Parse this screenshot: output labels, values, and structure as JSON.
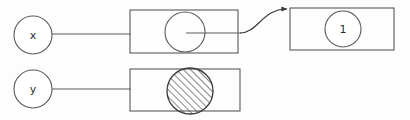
{
  "diagram": {
    "background_color": "#fdfdfd",
    "stroke_color": "#5a5a5a",
    "stroke_color_dark": "#3b3b3b",
    "text_color": "#2b2b2b",
    "fill_color": "#ffffff",
    "stroke_width": 1.1,
    "nodes": [
      {
        "id": "var-x",
        "kind": "circle-node",
        "label": "x",
        "cx": 33,
        "cy": 35,
        "r": 19,
        "filled": false,
        "hatched": false
      },
      {
        "id": "var-y",
        "kind": "circle-node",
        "label": "y",
        "cx": 33,
        "cy": 89,
        "r": 19,
        "filled": false,
        "hatched": false
      },
      {
        "id": "value-one",
        "kind": "circle-node",
        "label": "1",
        "cx": 343,
        "cy": 29,
        "r": 18,
        "filled": false,
        "hatched": false
      },
      {
        "id": "box-top-inner-circle",
        "kind": "circle-node",
        "label": "",
        "cx": 185,
        "cy": 32,
        "r": 20,
        "filled": false,
        "hatched": false
      },
      {
        "id": "box-bottom-inner-circle",
        "kind": "circle-node",
        "label": "",
        "cx": 190,
        "cy": 91,
        "r": 23,
        "filled": false,
        "hatched": true
      }
    ],
    "boxes": [
      {
        "id": "box-top-left",
        "x": 130,
        "y": 10,
        "width": 108,
        "height": 43
      },
      {
        "id": "box-top-right",
        "x": 290,
        "y": 8,
        "width": 104,
        "height": 42
      },
      {
        "id": "box-bottom",
        "x": 130,
        "y": 69,
        "width": 110,
        "height": 42
      }
    ],
    "edges": [
      {
        "id": "edge-x-to-box-top",
        "kind": "straight",
        "from": "var-x",
        "to": "box-top-left",
        "x1": 52,
        "y1": 34,
        "x2": 131,
        "y2": 34,
        "arrow": false
      },
      {
        "id": "edge-y-to-box-bottom",
        "kind": "straight",
        "from": "var-y",
        "to": "box-bottom",
        "x1": 52,
        "y1": 89,
        "x2": 131,
        "y2": 89,
        "arrow": false
      },
      {
        "id": "edge-circle-to-box-edge",
        "kind": "straight",
        "from": "box-top-inner-circle",
        "to": "box-top-left",
        "x1": 186,
        "y1": 33,
        "x2": 240,
        "y2": 33,
        "arrow": false
      },
      {
        "id": "edge-curve-to-value-box",
        "kind": "s-curve",
        "from": "box-top-left",
        "to": "box-top-right",
        "path": "M 240 33 C 258 33, 262 9, 288 9",
        "arrow": true,
        "arrow_x": 291,
        "arrow_y": 9
      }
    ],
    "hatch": {
      "angle_degrees": 45,
      "direction": "bottom-left-to-top-right",
      "spacing": 5,
      "line_width": 1.2,
      "color": "#4a4a4a"
    }
  }
}
